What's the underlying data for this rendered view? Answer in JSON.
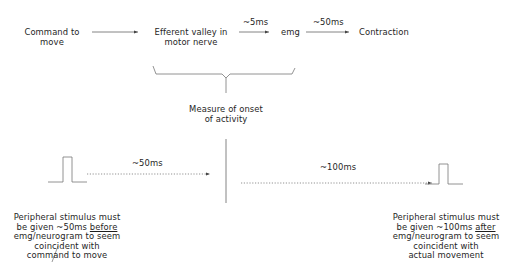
{
  "top_row": {
    "command": {
      "line1": "Command to",
      "line2": "move"
    },
    "efferent": {
      "line1": "Efferent valley in",
      "line2": "motor nerve"
    },
    "delay1": "~5ms",
    "emg": "emg",
    "delay2": "~50ms",
    "contraction": "Contraction"
  },
  "measure": {
    "line1": "Measure of onset",
    "line2": "of activity"
  },
  "left_timing": "~50ms",
  "right_timing": "~100ms",
  "left_note": {
    "line1": "Peripheral stimulus must",
    "line2_pre": "be given ~50ms ",
    "line2_em": "before",
    "line3": "emg/neurogram to seem",
    "line4": "coincident with",
    "line5": "command to move"
  },
  "right_note": {
    "line1": "Peripheral stimulus must",
    "line2_pre": "be given ~100ms ",
    "line2_em": "after",
    "line3": "emg/neurogram to seem",
    "line4": "coincident with",
    "line5": "actual movement"
  },
  "colors": {
    "line": "#6a6a6a",
    "text": "#1e1e1e"
  }
}
